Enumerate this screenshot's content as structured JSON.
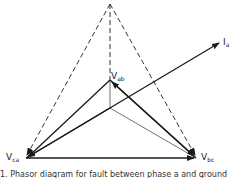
{
  "diagram": {
    "type": "phasor-diagram",
    "labels": {
      "vab": {
        "main": "V",
        "sub": "ab"
      },
      "vca": {
        "main": "V",
        "sub": "ca"
      },
      "vbc": {
        "main": "V",
        "sub": "bc"
      },
      "ia": {
        "main": "I",
        "sub": "a"
      }
    },
    "caption": "1. Phasor diagram for fault between phase a and ground",
    "colors": {
      "line": "#1a1a1a",
      "dashed": "#333333",
      "background": "#ffffff"
    }
  }
}
